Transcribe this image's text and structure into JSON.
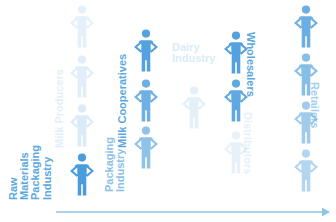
{
  "diagram": {
    "icon_name": "person-hands-on-hips-icon",
    "accent_color": "#4a9ddd",
    "label_color": "#5aa8e0",
    "arrow_color": "#8fc4e8",
    "background": "#ffffff",
    "arrow": {
      "name": "flow-arrow",
      "direction": "right",
      "x1": 56,
      "x2": 330,
      "y": 212
    },
    "columns": [
      {
        "id": "raw-materials-packaging-industry",
        "label": "Raw\nMaterials\nPackaging\nIndustry",
        "label_text": "Raw Materials Packaging Industry",
        "label_orientation": "vertical-ccw",
        "label_x": 8,
        "label_y": 200,
        "label_size": 11,
        "label_opacity": 1,
        "figure_x": 68,
        "figures": [
          {
            "y": 152,
            "opacity": 1.0
          }
        ]
      },
      {
        "id": "milk-producers",
        "label": "Milk Producers",
        "label_text": "Milk Producers",
        "label_orientation": "vertical-ccw",
        "label_x": 54,
        "label_y": 148,
        "label_size": 11,
        "label_opacity": 0.18,
        "figure_x": 68,
        "figures": [
          {
            "y": 4,
            "opacity": 0.14
          },
          {
            "y": 54,
            "opacity": 0.16
          },
          {
            "y": 103,
            "opacity": 0.2
          }
        ]
      },
      {
        "id": "milk-cooperatives",
        "label": "Milk Cooperatives",
        "label_text": "Milk Cooperatives",
        "label_orientation": "vertical-ccw",
        "label_x": 117,
        "label_y": 148,
        "label_size": 11,
        "label_opacity": 1,
        "figure_x": 132,
        "figures": [
          {
            "y": 28,
            "opacity": 0.95
          },
          {
            "y": 78,
            "opacity": 0.8
          }
        ]
      },
      {
        "id": "packaging-industry",
        "label": "Packaging\nIndustry",
        "label_text": "Packaging Industry",
        "label_orientation": "vertical-ccw",
        "label_x": 104,
        "label_y": 192,
        "label_size": 11,
        "label_opacity": 0.7,
        "figure_x": 132,
        "figures": [
          {
            "y": 125,
            "opacity": 0.62
          }
        ]
      },
      {
        "id": "dairy-industry",
        "label": "Dairy\nIndustry",
        "label_text": "Dairy Industry",
        "label_orientation": "horizontal",
        "label_x": 172,
        "label_y": 42,
        "label_size": 11,
        "label_opacity": 0.22,
        "figure_x": 180,
        "figures": [
          {
            "y": 85,
            "opacity": 0.15
          }
        ]
      },
      {
        "id": "wholesalers",
        "label": "Wholesalers",
        "label_text": "Wholesalers",
        "label_orientation": "vertical-cw",
        "label_x": 256,
        "label_y": 32,
        "label_size": 11,
        "label_opacity": 1,
        "figure_x": 222,
        "figures": [
          {
            "y": 30,
            "opacity": 0.95
          },
          {
            "y": 78,
            "opacity": 0.88
          }
        ]
      },
      {
        "id": "distributors",
        "label": "Distributors",
        "label_text": "Distributors",
        "label_orientation": "vertical-cw",
        "label_x": 253,
        "label_y": 112,
        "label_size": 11,
        "label_opacity": 0.16,
        "figure_x": 222,
        "figures": [
          {
            "y": 130,
            "opacity": 0.13
          }
        ]
      },
      {
        "id": "retailers",
        "label": "Retailers",
        "label_text": "Retailers",
        "label_orientation": "vertical-cw",
        "label_x": 320,
        "label_y": 82,
        "label_size": 11,
        "label_opacity": 0.55,
        "figure_x": 292,
        "figures": [
          {
            "y": 4,
            "opacity": 0.82
          },
          {
            "y": 52,
            "opacity": 0.66
          },
          {
            "y": 100,
            "opacity": 0.52
          },
          {
            "y": 148,
            "opacity": 0.42
          }
        ]
      }
    ]
  }
}
